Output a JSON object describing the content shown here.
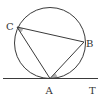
{
  "diagram": {
    "type": "circle-tangent-geometry",
    "colors": {
      "stroke": "#3a3a3a",
      "shade": "#b0b0b0",
      "background": "#ffffff"
    },
    "circle": {
      "cx": 50,
      "cy": 43,
      "r": 35.5
    },
    "points": {
      "A": {
        "label": "A",
        "x": 50,
        "y": 78.5
      },
      "B": {
        "label": "B",
        "x": 84,
        "y": 42
      },
      "C": {
        "label": "C",
        "x": 17,
        "y": 27
      },
      "T": {
        "label": "T",
        "x": 95,
        "y": 78.5
      }
    },
    "segments": [
      {
        "from": "C",
        "to": "B"
      },
      {
        "from": "C",
        "to": "A"
      },
      {
        "from": "A",
        "to": "B"
      }
    ],
    "tangent_line": {
      "through": "A",
      "x1": 3,
      "x2": 98
    },
    "shaded_angles": [
      {
        "vertex": "C",
        "between": [
          "A",
          "B"
        ]
      },
      {
        "vertex": "A",
        "between": [
          "B",
          "T"
        ]
      }
    ]
  }
}
